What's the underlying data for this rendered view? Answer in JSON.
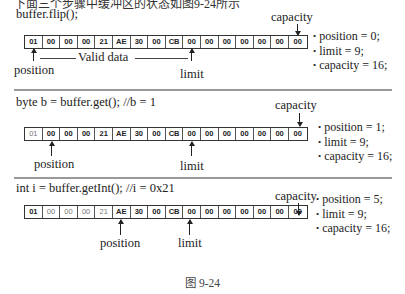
{
  "top_cut_text": "下面三个步骤中缓冲区的状态如图9-24所示",
  "bytes": [
    "01",
    "00",
    "00",
    "00",
    "21",
    "AE",
    "30",
    "00",
    "CB",
    "00",
    "00",
    "00",
    "00",
    "00",
    "00",
    "00"
  ],
  "panels": [
    {
      "code": "buffer.flip();",
      "position_label": "position",
      "limit_label": "limit",
      "capacity_label": "capacity",
      "valid_data_label": "Valid data",
      "stats": [
        "position = 0;",
        "limit = 9;",
        "capacity = 16;"
      ],
      "position_index": 0,
      "limit_index": 9,
      "dim_cells": []
    },
    {
      "code": "byte b = buffer.get(); //b = 1",
      "position_label": "position",
      "limit_label": "limit",
      "capacity_label": "capacity",
      "stats": [
        "position = 1;",
        "limit = 9;",
        "capacity = 16;"
      ],
      "position_index": 1,
      "limit_index": 9,
      "dim_cells": [
        0
      ]
    },
    {
      "code": "int i = buffer.getInt(); //i = 0x21",
      "position_label": "position",
      "limit_label": "limit",
      "capacity_label": "capacity",
      "stats": [
        "position = 5;",
        "limit = 9;",
        "capacity = 16;"
      ],
      "position_index": 5,
      "limit_index": 9,
      "dim_cells": [
        1,
        2,
        3,
        4
      ]
    }
  ],
  "caption": "图 9-24"
}
